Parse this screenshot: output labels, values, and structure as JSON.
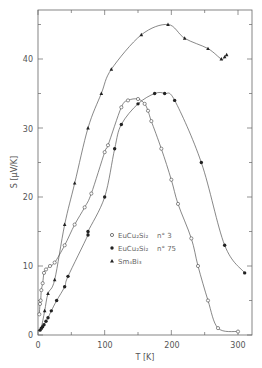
{
  "chart_data": {
    "type": "line",
    "title": "",
    "xlabel": "T [K]",
    "ylabel": "S [μV/K]",
    "xlim": [
      0,
      320
    ],
    "ylim": [
      0,
      46
    ],
    "x_ticks": [
      0,
      100,
      200,
      300
    ],
    "y_ticks": [
      0,
      10,
      20,
      30,
      40
    ],
    "grid": false,
    "legend_position": "center-right",
    "series": [
      {
        "name": "EuCu2Si2 n°3",
        "legend_label": "EuCu₂Si₂",
        "legend_suffix": "n°3",
        "marker": "open-circle",
        "points": [
          [
            2,
            3
          ],
          [
            3,
            4.5
          ],
          [
            4,
            5
          ],
          [
            5,
            6.5
          ],
          [
            7,
            7.5
          ],
          [
            9,
            9
          ],
          [
            12,
            9.5
          ],
          [
            18,
            10
          ],
          [
            25,
            10.5
          ],
          [
            40,
            13
          ],
          [
            55,
            16
          ],
          [
            70,
            18.5
          ],
          [
            80,
            20.5
          ],
          [
            100,
            26.5
          ],
          [
            105,
            27.5
          ],
          [
            125,
            33
          ],
          [
            135,
            34
          ],
          [
            150,
            34.2
          ],
          [
            160,
            33.5
          ],
          [
            165,
            32.5
          ],
          [
            170,
            31
          ],
          [
            185,
            27
          ],
          [
            200,
            22.5
          ],
          [
            210,
            19
          ],
          [
            230,
            14
          ],
          [
            240,
            10
          ],
          [
            255,
            5
          ],
          [
            270,
            1
          ],
          [
            300,
            0.5
          ]
        ]
      },
      {
        "name": "EuCu2Si2 n°75",
        "legend_label": "EuCu₂Si₂",
        "legend_suffix": "n°75",
        "marker": "filled-circle",
        "points": [
          [
            3,
            0.7
          ],
          [
            5,
            1
          ],
          [
            7,
            1.2
          ],
          [
            9,
            1.5
          ],
          [
            12,
            2
          ],
          [
            15,
            2.5
          ],
          [
            20,
            3.5
          ],
          [
            28,
            5
          ],
          [
            40,
            7
          ],
          [
            45,
            8.5
          ],
          [
            75,
            14.5
          ],
          [
            75,
            15
          ],
          [
            100,
            20
          ],
          [
            115,
            27
          ],
          [
            125,
            30.5
          ],
          [
            150,
            33.5
          ],
          [
            175,
            35
          ],
          [
            190,
            35
          ],
          [
            205,
            34
          ],
          [
            245,
            25
          ],
          [
            280,
            13
          ],
          [
            310,
            9
          ]
        ]
      },
      {
        "name": "Sm4Bi3",
        "legend_label": "Sm₄Bi₃",
        "legend_suffix": "",
        "marker": "filled-triangle",
        "points": [
          [
            5,
            1
          ],
          [
            10,
            3.5
          ],
          [
            15,
            6
          ],
          [
            25,
            8
          ],
          [
            40,
            16
          ],
          [
            55,
            22
          ],
          [
            75,
            30
          ],
          [
            95,
            35
          ],
          [
            110,
            38.5
          ],
          [
            155,
            43.5
          ],
          [
            195,
            45
          ],
          [
            220,
            43
          ],
          [
            255,
            41.5
          ],
          [
            275,
            40
          ],
          [
            280,
            40.3
          ],
          [
            283,
            40.6
          ]
        ]
      }
    ]
  },
  "legend": {
    "items": [
      {
        "label": "EuCu₂Si₂",
        "suffix": "n° 3"
      },
      {
        "label": "EuCu₂Si₂",
        "suffix": "n° 75"
      },
      {
        "label": "Sm₄Bi₃",
        "suffix": ""
      }
    ]
  },
  "axes": {
    "x_label": "T  [K]",
    "y_label": "S  [μV/K]",
    "x_tick_labels": [
      "0",
      "100",
      "200",
      "300"
    ],
    "y_tick_labels": [
      "0",
      "10",
      "20",
      "30",
      "40"
    ]
  }
}
